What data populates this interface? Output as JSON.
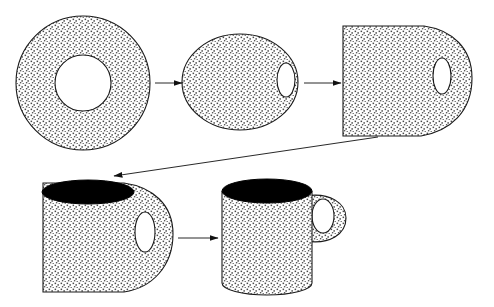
{
  "figure": {
    "background_color": "#ffffff",
    "width": 494,
    "height": 307,
    "stipple_fill_color": "#555555",
    "outline_color": "#1a1a1a",
    "cavity_fill_color": "#000000",
    "arrow_color": "#111111",
    "stage_count": 5,
    "arrow_count": 4
  },
  "stages": [
    {
      "id": "torus-donut",
      "label": "Torus (donut)",
      "shape_kind": "annulus",
      "outer": {
        "cx": 83,
        "cy": 83,
        "rx": 67,
        "ry": 66
      },
      "hole": {
        "cx": 83,
        "cy": 83,
        "rx": 28,
        "ry": 28
      }
    },
    {
      "id": "flattened-ellipse",
      "label": "Flattened ellipse with offset hole",
      "shape_kind": "ellipse-with-hole",
      "outer": {
        "cx": 240,
        "cy": 82,
        "rx": 58,
        "ry": 48
      },
      "hole": {
        "cx": 286,
        "cy": 80,
        "rx": 9,
        "ry": 17
      }
    },
    {
      "id": "squared-block",
      "label": "Squared block with handle lobe",
      "shape_kind": "block-with-lobe",
      "bounds": {
        "x": 343,
        "y": 26,
        "width": 130,
        "height": 110
      },
      "hole": {
        "cx": 442,
        "cy": 76,
        "rx": 9,
        "ry": 18
      }
    },
    {
      "id": "hollowed-block",
      "label": "Block hollowed into a cup cavity",
      "shape_kind": "block-with-lobe-and-cavity",
      "bounds": {
        "x": 43,
        "y": 186,
        "width": 130,
        "height": 108
      },
      "cavity": {
        "cx": 88,
        "cy": 192,
        "rx": 46,
        "ry": 12
      },
      "hole": {
        "cx": 145,
        "cy": 232,
        "rx": 10,
        "ry": 20
      }
    },
    {
      "id": "coffee-mug",
      "label": "Coffee mug",
      "shape_kind": "cylinder-with-handle",
      "bounds": {
        "x": 222,
        "y": 191,
        "width": 90,
        "height": 104
      },
      "cavity": {
        "cx": 267,
        "cy": 191,
        "rx": 45,
        "ry": 12
      },
      "handle_hole": {
        "cx": 323,
        "cy": 216,
        "rx": 11,
        "ry": 17
      }
    }
  ],
  "arrows": [
    {
      "id": "arrow-donut-to-ellipse",
      "label": "donut to ellipse",
      "from": {
        "x": 155,
        "y": 83
      },
      "to": {
        "x": 182,
        "y": 83
      },
      "direction": "right"
    },
    {
      "id": "arrow-ellipse-to-block",
      "label": "ellipse to block",
      "from": {
        "x": 304,
        "y": 83
      },
      "to": {
        "x": 341,
        "y": 83
      },
      "direction": "right"
    },
    {
      "id": "arrow-block-to-hollowed",
      "label": "block to hollowed block",
      "from": {
        "x": 378,
        "y": 137
      },
      "to": {
        "x": 114,
        "y": 176
      },
      "direction": "down-left"
    },
    {
      "id": "arrow-hollowed-to-mug",
      "label": "hollowed block to mug",
      "from": {
        "x": 178,
        "y": 238
      },
      "to": {
        "x": 218,
        "y": 238
      },
      "direction": "right"
    }
  ]
}
